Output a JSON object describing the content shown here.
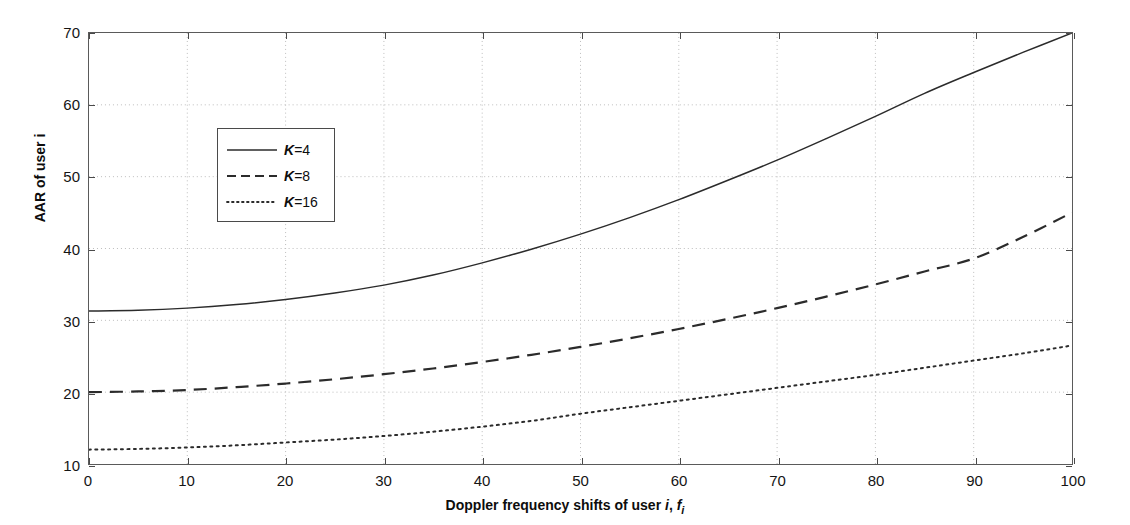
{
  "chart_data": {
    "type": "line",
    "title": "",
    "xlabel_parts": {
      "lead": "Doppler frequency shifts of user ",
      "var1": "i",
      "comma": ", ",
      "var2": "f",
      "sub": "i"
    },
    "xlabel": "Doppler frequency shifts of user i, f_i",
    "ylabel": "AAR of user i",
    "xlim": [
      0,
      100
    ],
    "ylim": [
      10,
      70
    ],
    "xticks": [
      0,
      10,
      20,
      30,
      40,
      50,
      60,
      70,
      80,
      90,
      100
    ],
    "yticks": [
      10,
      20,
      30,
      40,
      50,
      60,
      70
    ],
    "grid": true,
    "grid_style": "dotted",
    "grid_color": "#bdbdbd",
    "legend_position": "upper-left-inset",
    "x": [
      0,
      5,
      10,
      15,
      20,
      25,
      30,
      35,
      40,
      45,
      50,
      55,
      60,
      65,
      70,
      75,
      80,
      85,
      90,
      95,
      100
    ],
    "series": [
      {
        "name": "K=4",
        "k_value": 4,
        "label_prefix": "K",
        "label_suffix": "=4",
        "style": "solid",
        "color": "#2b2b2b",
        "values": [
          31.3,
          31.4,
          31.7,
          32.2,
          32.9,
          33.8,
          34.9,
          36.3,
          38.0,
          39.9,
          42.0,
          44.3,
          46.8,
          49.5,
          52.3,
          55.3,
          58.4,
          61.6,
          64.5,
          67.3,
          70.0
        ]
      },
      {
        "name": "K=8",
        "k_value": 8,
        "label_prefix": "K",
        "label_suffix": "=8",
        "style": "dashed",
        "color": "#2b2b2b",
        "values": [
          20.0,
          20.1,
          20.3,
          20.7,
          21.2,
          21.8,
          22.5,
          23.3,
          24.2,
          25.2,
          26.3,
          27.5,
          28.8,
          30.2,
          31.7,
          33.3,
          35.0,
          36.8,
          38.6,
          41.6,
          45.0
        ]
      },
      {
        "name": "K=16",
        "k_value": 16,
        "label_prefix": "K",
        "label_suffix": "=16",
        "style": "dotted",
        "color": "#2b2b2b",
        "values": [
          12.0,
          12.1,
          12.3,
          12.6,
          13.0,
          13.4,
          13.9,
          14.5,
          15.2,
          16.0,
          17.0,
          17.9,
          18.8,
          19.7,
          20.6,
          21.5,
          22.4,
          23.4,
          24.4,
          25.4,
          26.5
        ]
      }
    ]
  },
  "legend": {
    "items": [
      {
        "label_k": "K",
        "label_rest": "=4"
      },
      {
        "label_k": "K",
        "label_rest": "=8"
      },
      {
        "label_k": "K",
        "label_rest": "=16"
      }
    ]
  },
  "axes": {
    "x_title_lead": "Doppler frequency shifts of user ",
    "x_title_i": "i",
    "x_title_sep": ", ",
    "x_title_f": "f",
    "x_title_fsub": "i",
    "y_title": "AAR of user i"
  }
}
